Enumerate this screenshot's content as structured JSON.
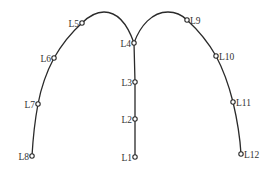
{
  "diagram": {
    "type": "node-path-diagram",
    "colors": {
      "line": "#2a2a2a",
      "node_fill": "#ffffff",
      "label": "#333333"
    },
    "nodes": [
      {
        "id": "L1",
        "label": "L1",
        "x": 135,
        "y": 157,
        "label_side": "left"
      },
      {
        "id": "L2",
        "label": "L2",
        "x": 135,
        "y": 119,
        "label_side": "left"
      },
      {
        "id": "L3",
        "label": "L3",
        "x": 135,
        "y": 82,
        "label_side": "left"
      },
      {
        "id": "L4",
        "label": "L4",
        "x": 134,
        "y": 43,
        "label_side": "left"
      },
      {
        "id": "L5",
        "label": "L5",
        "x": 82,
        "y": 23,
        "label_side": "left"
      },
      {
        "id": "L6",
        "label": "L6",
        "x": 54,
        "y": 58,
        "label_side": "left"
      },
      {
        "id": "L7",
        "label": "L7",
        "x": 38,
        "y": 104,
        "label_side": "left"
      },
      {
        "id": "L8",
        "label": "L8",
        "x": 32,
        "y": 156,
        "label_side": "left"
      },
      {
        "id": "L9",
        "label": "L9",
        "x": 187,
        "y": 20,
        "label_side": "right"
      },
      {
        "id": "L10",
        "label": "L10",
        "x": 216,
        "y": 56,
        "label_side": "right"
      },
      {
        "id": "L11",
        "label": "L11",
        "x": 233,
        "y": 102,
        "label_side": "right"
      },
      {
        "id": "L12",
        "label": "L12",
        "x": 241,
        "y": 154,
        "label_side": "right"
      }
    ],
    "edges": [
      {
        "from": "L1",
        "to": "L2",
        "shape": "straight"
      },
      {
        "from": "L2",
        "to": "L3",
        "shape": "straight"
      },
      {
        "from": "L3",
        "to": "L4",
        "shape": "straight"
      },
      {
        "from": "L4",
        "to": "L5",
        "shape": "arc"
      },
      {
        "from": "L5",
        "to": "L6",
        "shape": "arc"
      },
      {
        "from": "L6",
        "to": "L7",
        "shape": "arc"
      },
      {
        "from": "L7",
        "to": "L8",
        "shape": "arc"
      },
      {
        "from": "L4",
        "to": "L9",
        "shape": "arc"
      },
      {
        "from": "L9",
        "to": "L10",
        "shape": "arc"
      },
      {
        "from": "L10",
        "to": "L11",
        "shape": "arc"
      },
      {
        "from": "L11",
        "to": "L12",
        "shape": "arc"
      }
    ]
  }
}
